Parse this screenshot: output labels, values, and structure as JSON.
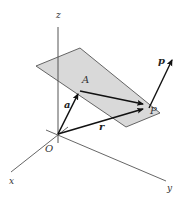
{
  "diagram": {
    "type": "vector-plane-3d",
    "colors": {
      "plane_fill": "#d9d9d9",
      "plane_stroke": "#555555",
      "axis": "#555555",
      "vector": "#111111",
      "label": "#333333"
    },
    "axes": {
      "z": {
        "label": "z"
      },
      "x": {
        "label": "x"
      },
      "y": {
        "label": "y"
      }
    },
    "points": {
      "origin": {
        "label": "O"
      },
      "A": {
        "label": "A"
      },
      "P": {
        "label": "P"
      }
    },
    "vectors": {
      "a": {
        "label": "a",
        "from": "O",
        "to": "A"
      },
      "r": {
        "label": "r",
        "from": "O",
        "to": "P"
      },
      "AP": {
        "label": "",
        "from": "A",
        "to": "P"
      },
      "p": {
        "label": "p",
        "from": "P",
        "direction": "normal-up-right"
      }
    }
  }
}
